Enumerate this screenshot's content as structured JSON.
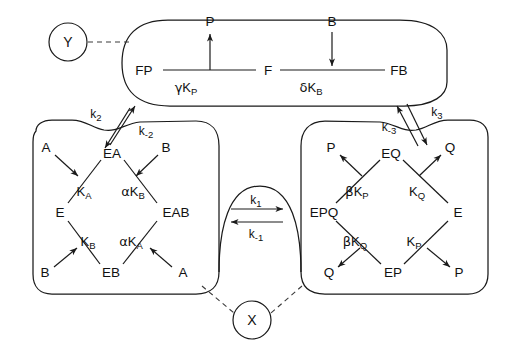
{
  "figure": {
    "regulators": [
      {
        "id": "Y",
        "label": "Y",
        "cx": 68,
        "cy": 42,
        "r": 19
      },
      {
        "id": "X",
        "label": "X",
        "cx": 252,
        "cy": 320,
        "r": 19
      }
    ],
    "compartments": [
      {
        "id": "top-lobe",
        "name": "F-form-compartment"
      },
      {
        "id": "lower-left-lobe",
        "name": "E-substrate-compartment"
      },
      {
        "id": "lower-right-lobe",
        "name": "E-product-compartment"
      }
    ]
  },
  "top_scheme": {
    "nodes": [
      {
        "id": "FP",
        "label": "FP",
        "x": 144,
        "y": 74
      },
      {
        "id": "F",
        "label": "F",
        "x": 267,
        "y": 74
      },
      {
        "id": "FB",
        "label": "FB",
        "x": 398,
        "y": 74
      }
    ],
    "ligands": [
      {
        "id": "P-out",
        "label": "P",
        "x": 193,
        "y": 22,
        "direction": "up"
      },
      {
        "id": "B-in",
        "label": "B",
        "x": 328,
        "y": 22,
        "direction": "down"
      }
    ],
    "constants": [
      {
        "id": "gamma-KP",
        "greek": "γ",
        "base": "K",
        "sub": "P",
        "x": 177,
        "y": 91
      },
      {
        "id": "delta-KB",
        "greek": "δ",
        "base": "K",
        "sub": "B",
        "x": 312,
        "y": 91
      }
    ]
  },
  "left_scheme": {
    "nodes": [
      {
        "id": "EA",
        "label": "EA",
        "x": 112,
        "y": 153
      },
      {
        "id": "E",
        "label": "E",
        "x": 63,
        "y": 212
      },
      {
        "id": "EAB",
        "label": "EAB",
        "x": 168,
        "y": 212
      },
      {
        "id": "EB",
        "label": "EB",
        "x": 110,
        "y": 271
      }
    ],
    "ligands": [
      {
        "id": "A-top",
        "label": "A",
        "x": 48,
        "y": 148
      },
      {
        "id": "B-top",
        "label": "B",
        "x": 158,
        "y": 148
      },
      {
        "id": "B-bottom",
        "label": "B",
        "x": 47,
        "y": 272
      },
      {
        "id": "A-bottom",
        "label": "A",
        "x": 177,
        "y": 272
      }
    ],
    "constants": [
      {
        "id": "KA",
        "greek": "",
        "base": "K",
        "sub": "A",
        "x": 82,
        "y": 190
      },
      {
        "id": "alpha-KB",
        "greek": "α",
        "base": "K",
        "sub": "B",
        "x": 131,
        "y": 190
      },
      {
        "id": "KB",
        "greek": "",
        "base": "K",
        "sub": "B",
        "x": 86,
        "y": 240
      },
      {
        "id": "alpha-KA",
        "greek": "α",
        "base": "K",
        "sub": "A",
        "x": 128,
        "y": 240
      }
    ]
  },
  "right_scheme": {
    "nodes": [
      {
        "id": "EQ",
        "label": "EQ",
        "x": 391,
        "y": 153
      },
      {
        "id": "EPQ",
        "label": "EPQ",
        "x": 320,
        "y": 212
      },
      {
        "id": "E",
        "label": "E",
        "x": 455,
        "y": 212
      },
      {
        "id": "EP",
        "label": "EP",
        "x": 393,
        "y": 271
      }
    ],
    "ligands": [
      {
        "id": "P-upper",
        "label": "P",
        "x": 331,
        "y": 148
      },
      {
        "id": "Q-upper",
        "label": "Q",
        "x": 448,
        "y": 148
      },
      {
        "id": "Q-lower",
        "label": "Q",
        "x": 330,
        "y": 272
      },
      {
        "id": "P-lower",
        "label": "P",
        "x": 458,
        "y": 272
      }
    ],
    "constants": [
      {
        "id": "beta-KP",
        "greek": "β",
        "base": "K",
        "sub": "P",
        "x": 352,
        "y": 190
      },
      {
        "id": "KQ",
        "greek": "",
        "base": "K",
        "sub": "Q",
        "x": 414,
        "y": 190
      },
      {
        "id": "beta-KQ",
        "greek": "β",
        "base": "K",
        "sub": "Q",
        "x": 350,
        "y": 240
      },
      {
        "id": "KP",
        "greek": "",
        "base": "K",
        "sub": "P",
        "x": 411,
        "y": 240
      }
    ]
  },
  "rate_constants": [
    {
      "id": "k1",
      "base": "k",
      "sub": "1",
      "x": 247,
      "y": 196,
      "arrow": "right"
    },
    {
      "id": "k-1",
      "base": "k",
      "sub": "-1",
      "x": 247,
      "y": 228,
      "arrow": "left"
    },
    {
      "id": "k2",
      "base": "k",
      "sub": "2",
      "x": 95,
      "y": 113,
      "arrow": "up-right"
    },
    {
      "id": "k-2",
      "base": "k",
      "sub": "-2",
      "x": 131,
      "y": 131,
      "arrow": "down-left"
    },
    {
      "id": "k-3",
      "base": "k",
      "sub": "-3",
      "x": 390,
      "y": 126,
      "arrow": "up-left"
    },
    {
      "id": "k3",
      "base": "k",
      "sub": "3",
      "x": 433,
      "y": 111,
      "arrow": "down-right"
    }
  ],
  "colors": {
    "ink": "#1a1a1a",
    "dashed": "#3a3a3a",
    "background": "#ffffff"
  }
}
